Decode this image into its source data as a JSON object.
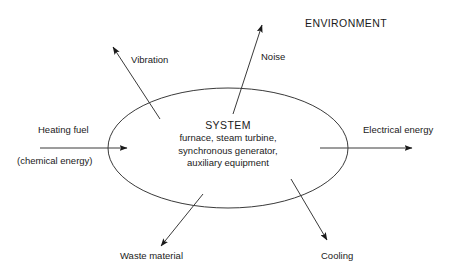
{
  "diagram": {
    "environment_label": "ENVIRONMENT",
    "boundary": {
      "shape": "ellipse",
      "cx": 228,
      "cy": 148,
      "rx": 120,
      "ry": 60,
      "stroke": "#3a3a3a"
    },
    "system": {
      "title": "SYSTEM",
      "components": [
        "furnace, steam turbine,",
        "synchronous generator,",
        "auxiliary equipment"
      ]
    },
    "flows": [
      {
        "id": "heating-fuel",
        "label": "Heating fuel",
        "sublabel": "(chemical energy)",
        "direction": "input",
        "x1": 40,
        "y1": 148,
        "x2": 127,
        "y2": 148
      },
      {
        "id": "electrical-energy",
        "label": "Electrical energy",
        "direction": "output",
        "x1": 320,
        "y1": 148,
        "x2": 412,
        "y2": 148
      },
      {
        "id": "vibration",
        "label": "Vibration",
        "direction": "output",
        "x1": 160,
        "y1": 119,
        "x2": 113,
        "y2": 47
      },
      {
        "id": "noise",
        "label": "Noise",
        "direction": "output",
        "x1": 233,
        "y1": 114,
        "x2": 262,
        "y2": 25
      },
      {
        "id": "waste-material",
        "label": "Waste material",
        "direction": "output",
        "x1": 203,
        "y1": 194,
        "x2": 161,
        "y2": 246
      },
      {
        "id": "cooling",
        "label": "Cooling",
        "direction": "output",
        "x1": 291,
        "y1": 179,
        "x2": 327,
        "y2": 240
      }
    ],
    "colors": {
      "line": "#3a3a3a",
      "text": "#1a1a1a",
      "background": "#ffffff"
    }
  }
}
